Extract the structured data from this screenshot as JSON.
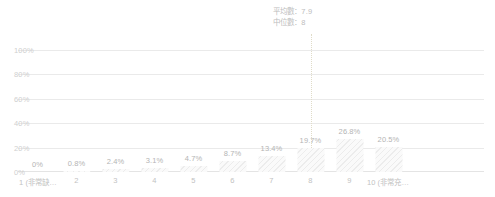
{
  "chart_data": {
    "type": "bar",
    "title": "",
    "subtitle": "",
    "xlabel": "",
    "ylabel": "",
    "categories": [
      "1 (非常缺…",
      "2",
      "3",
      "4",
      "5",
      "6",
      "7",
      "8",
      "9",
      "10 (非常充…"
    ],
    "values": [
      0,
      0.8,
      2.4,
      3.1,
      4.7,
      8.7,
      13.4,
      19.7,
      26.8,
      20.5
    ],
    "value_labels": [
      "0%",
      "0.8%",
      "2.4%",
      "3.1%",
      "4.7%",
      "8.7%",
      "13.4%",
      "19.7%",
      "26.8%",
      "20.5%"
    ],
    "ylim": [
      0,
      100
    ],
    "y_ticks": [
      0,
      20,
      40,
      60,
      80,
      100
    ],
    "y_tick_labels": [
      "0%",
      "20%",
      "40%",
      "60%",
      "80%",
      "100%"
    ],
    "grid": true,
    "legend": "none",
    "annotations": {
      "mean_label": "平均數：7.9",
      "median_label": "中位數：8",
      "mean_value": 7.9,
      "median_value": 8,
      "marker_category_index": 7
    }
  },
  "colors": {
    "bar_fill": "#fafafa",
    "bar_hatch": "#ececec",
    "gridline": "#eaeaea",
    "axis_text": "#c2c2c2",
    "value_text": "#b4b4b4",
    "y_axis_text": "#cfcfcf",
    "marker_line": "#e0dcc8",
    "annotation_text": "#bdbdbd",
    "background": "#ffffff"
  }
}
